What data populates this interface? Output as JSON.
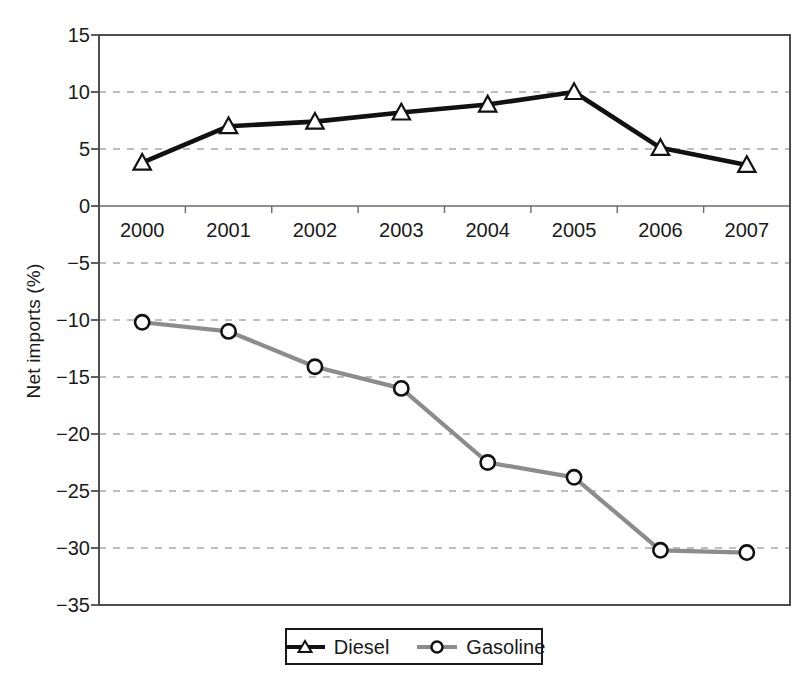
{
  "chart_data": {
    "type": "line",
    "title": "",
    "xlabel": "",
    "ylabel": "Net imports (%)",
    "categories": [
      "2000",
      "2001",
      "2002",
      "2003",
      "2004",
      "2005",
      "2006",
      "2007"
    ],
    "ylim": [
      -35,
      15
    ],
    "ytick_labels": [
      "15",
      "10",
      "5",
      "0",
      "−5",
      "−10",
      "−15",
      "−20",
      "−25",
      "−30",
      "−35"
    ],
    "ytick_values": [
      15,
      10,
      5,
      0,
      -5,
      -10,
      -15,
      -20,
      -25,
      -30,
      -35
    ],
    "grid": true,
    "grid_style": "dashed-horizontal",
    "legend_position": "bottom-center",
    "series": [
      {
        "name": "Diesel",
        "color": "#111111",
        "marker": "open-triangle",
        "values": [
          3.8,
          7.0,
          7.4,
          8.2,
          8.9,
          10.0,
          5.1,
          3.6
        ]
      },
      {
        "name": "Gasoline",
        "color": "#8c8c8c",
        "marker": "open-circle",
        "values": [
          -10.2,
          -11.0,
          -14.1,
          -16.0,
          -22.5,
          -23.8,
          -30.2,
          -30.4
        ]
      }
    ]
  },
  "legend": {
    "items": [
      {
        "label": "Diesel"
      },
      {
        "label": "Gasoline"
      }
    ]
  },
  "colors": {
    "diesel": "#111111",
    "gasoline": "#8c8c8c",
    "grid": "#a9a9a9",
    "axis": "#4d4d4d",
    "text": "#1a1a1a"
  }
}
